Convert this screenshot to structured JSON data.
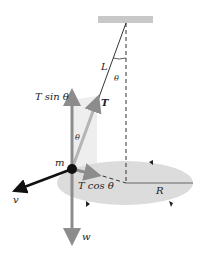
{
  "diagram": {
    "labels": {
      "length": "L",
      "angle_top": "θ",
      "angle_side": "θ",
      "tension": "T",
      "t_sin": "T sin θ",
      "t_cos": "T cos θ",
      "mass": "m",
      "velocity": "v",
      "weight": "w",
      "radius": "R"
    },
    "colors": {
      "ceiling": "#c8c8c8",
      "ellipse": "#dcdcdc",
      "string": "#333333",
      "force_grey": "#8c8c8c",
      "velocity": "#111111",
      "cone_shade": "#eeeeee"
    }
  }
}
